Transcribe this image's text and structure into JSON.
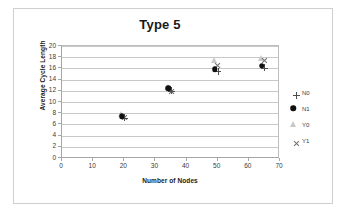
{
  "chart_data": {
    "type": "scatter",
    "title": "Type 5",
    "xlabel": "Number of Nodes",
    "ylabel": "Average Cycle Length",
    "xlim": [
      0,
      70
    ],
    "ylim": [
      0,
      20
    ],
    "xticks": [
      0,
      10,
      20,
      30,
      40,
      50,
      60,
      70
    ],
    "yticks": [
      0,
      2,
      4,
      6,
      8,
      10,
      12,
      14,
      16,
      18,
      20
    ],
    "grid": "horizontal",
    "legend_position": "right",
    "x": [
      20,
      35,
      50,
      65
    ],
    "series": [
      {
        "name": "N0",
        "marker": "plus",
        "color": "#4d4d4d",
        "values": [
          7.2,
          12.0,
          15.5,
          16.1
        ]
      },
      {
        "name": "N1",
        "marker": "circle",
        "color": "#111111",
        "values": [
          7.0,
          12.0,
          15.4,
          16.0
        ]
      },
      {
        "name": "Y0",
        "marker": "triangle",
        "color": "#c9c9c9",
        "values": [
          7.4,
          12.1,
          17.0,
          17.3
        ]
      },
      {
        "name": "Y1",
        "marker": "cross",
        "color": "#707070",
        "values": [
          7.3,
          12.0,
          16.6,
          17.5
        ]
      }
    ]
  },
  "legend": {
    "items": [
      {
        "label": "N0"
      },
      {
        "label": "N1"
      },
      {
        "label": "Y0"
      },
      {
        "label": "Y1"
      }
    ]
  }
}
